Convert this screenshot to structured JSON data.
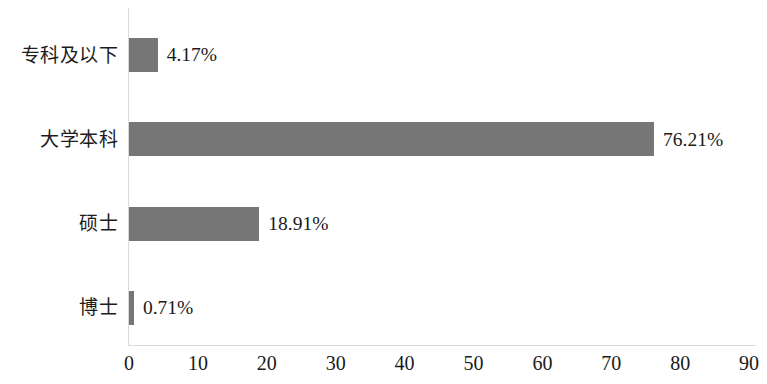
{
  "chart_data": {
    "type": "bar",
    "orientation": "horizontal",
    "title": "",
    "subtitle": "",
    "xlabel": "",
    "ylabel": "",
    "categories": [
      "专科及以下",
      "大学本科",
      "硕士",
      "博士"
    ],
    "values": [
      4.17,
      76.21,
      18.91,
      0.71
    ],
    "value_labels": [
      "4.17%",
      "76.21%",
      "18.91%",
      "0.71%"
    ],
    "xlim": [
      0,
      90
    ],
    "xticks": [
      0,
      10,
      20,
      30,
      40,
      50,
      60,
      70,
      80,
      90
    ],
    "xtick_labels": [
      "0",
      "10",
      "20",
      "30",
      "40",
      "50",
      "60",
      "70",
      "80",
      "90"
    ],
    "grid": false,
    "legend": false,
    "legend_position": "none",
    "bar_color": "#767676",
    "axis_color": "#d9d9d9",
    "text_color": "#1a1a1a",
    "background": "#ffffff"
  }
}
